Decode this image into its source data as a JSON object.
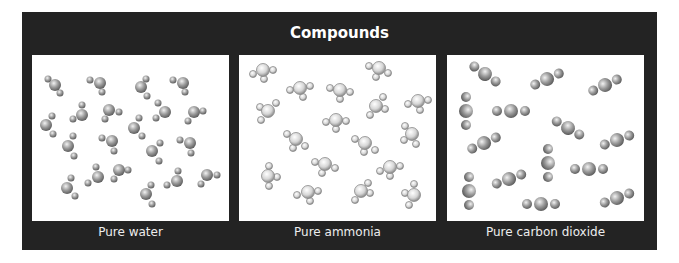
{
  "figure": {
    "title": "Compounds",
    "panels": [
      {
        "caption": "Pure water",
        "molecule": "H2O",
        "shading": "gray"
      },
      {
        "caption": "Pure ammonia",
        "molecule": "NH3",
        "shading": "light"
      },
      {
        "caption": "Pure carbon dioxide",
        "molecule": "CO2",
        "shading": "gray"
      }
    ]
  },
  "colors": {
    "frame": "#232323",
    "panel_bg": "#ffffff",
    "title_text": "#ffffff",
    "caption_text": "#ededed"
  }
}
